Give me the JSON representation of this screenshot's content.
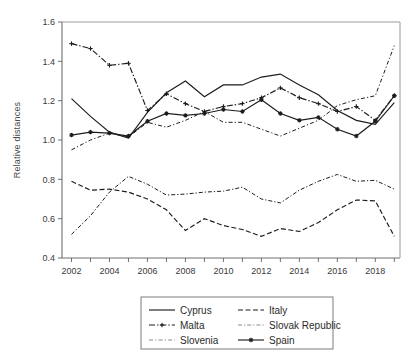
{
  "chart_data": {
    "type": "line",
    "title": "",
    "xlabel": "",
    "ylabel": "Relative distances",
    "xlim": [
      2001.5,
      2019.3
    ],
    "ylim": [
      0.4,
      1.6
    ],
    "yticks": [
      "0.4",
      "0.6",
      "0.8",
      "1.0",
      "1.2",
      "1.4",
      "1.6"
    ],
    "ytick_values": [
      0.4,
      0.6,
      0.8,
      1.0,
      1.2,
      1.4,
      1.6
    ],
    "xticks": [
      "2002",
      "2004",
      "2006",
      "2008",
      "2010",
      "2012",
      "2014",
      "2016",
      "2018"
    ],
    "xtick_values": [
      2002,
      2004,
      2006,
      2008,
      2010,
      2012,
      2014,
      2016,
      2018
    ],
    "grid": false,
    "legend_position": "bottom-center",
    "x": [
      2002,
      2003,
      2004,
      2005,
      2006,
      2007,
      2008,
      2009,
      2010,
      2011,
      2012,
      2013,
      2014,
      2015,
      2016,
      2017,
      2018,
      2019
    ],
    "series": [
      {
        "name": "Cyprus",
        "style": "solid",
        "marker": "none",
        "color": "#1c1c1c",
        "values": [
          1.21,
          1.12,
          1.04,
          1.01,
          1.14,
          1.24,
          1.3,
          1.22,
          1.28,
          1.28,
          1.32,
          1.335,
          1.28,
          1.23,
          1.15,
          1.1,
          1.08,
          1.19
        ]
      },
      {
        "name": "Italy",
        "style": "dashed",
        "marker": "none",
        "color": "#1c1c1c",
        "values": [
          0.79,
          0.745,
          0.75,
          0.735,
          0.7,
          0.645,
          0.54,
          0.6,
          0.565,
          0.545,
          0.51,
          0.55,
          0.535,
          0.58,
          0.645,
          0.695,
          0.69,
          0.51
        ]
      },
      {
        "name": "Malta",
        "style": "dashdot",
        "marker": "plus",
        "color": "#1c1c1c",
        "values": [
          1.49,
          1.465,
          1.38,
          1.39,
          1.15,
          1.235,
          1.185,
          1.145,
          1.17,
          1.185,
          1.215,
          1.265,
          1.215,
          1.185,
          1.145,
          1.17,
          1.1,
          1.225
        ]
      },
      {
        "name": "Slovak Republic",
        "style": "dashdot-light",
        "marker": "none",
        "color": "#8a8a8a",
        "values": [
          0.52,
          0.615,
          0.735,
          0.815,
          0.775,
          0.72,
          0.725,
          0.735,
          0.74,
          0.76,
          0.7,
          0.68,
          0.745,
          0.79,
          0.825,
          0.79,
          0.795,
          0.75
        ]
      },
      {
        "name": "Slovenia",
        "style": "dashdot-fine",
        "marker": "none",
        "color": "#8a8a8a",
        "values": [
          0.95,
          1.0,
          1.035,
          1.015,
          1.09,
          1.065,
          1.1,
          1.145,
          1.09,
          1.09,
          1.055,
          1.02,
          1.06,
          1.1,
          1.175,
          1.205,
          1.225,
          1.48
        ]
      },
      {
        "name": "Spain",
        "style": "solid",
        "marker": "star",
        "color": "#1c1c1c",
        "values": [
          1.025,
          1.04,
          1.035,
          1.02,
          1.095,
          1.135,
          1.125,
          1.135,
          1.155,
          1.145,
          1.205,
          1.135,
          1.1,
          1.115,
          1.055,
          1.02,
          1.095,
          1.225
        ]
      }
    ]
  },
  "legend": {
    "entries": [
      {
        "label": "Cyprus",
        "style": "solid",
        "marker": "none"
      },
      {
        "label": "Italy",
        "style": "dashed",
        "marker": "none"
      },
      {
        "label": "Malta",
        "style": "dashdot",
        "marker": "plus"
      },
      {
        "label": "Slovak Republic",
        "style": "dashdot-light",
        "marker": "none"
      },
      {
        "label": "Slovenia",
        "style": "dashdot-fine",
        "marker": "none"
      },
      {
        "label": "Spain",
        "style": "solid",
        "marker": "star"
      }
    ]
  }
}
